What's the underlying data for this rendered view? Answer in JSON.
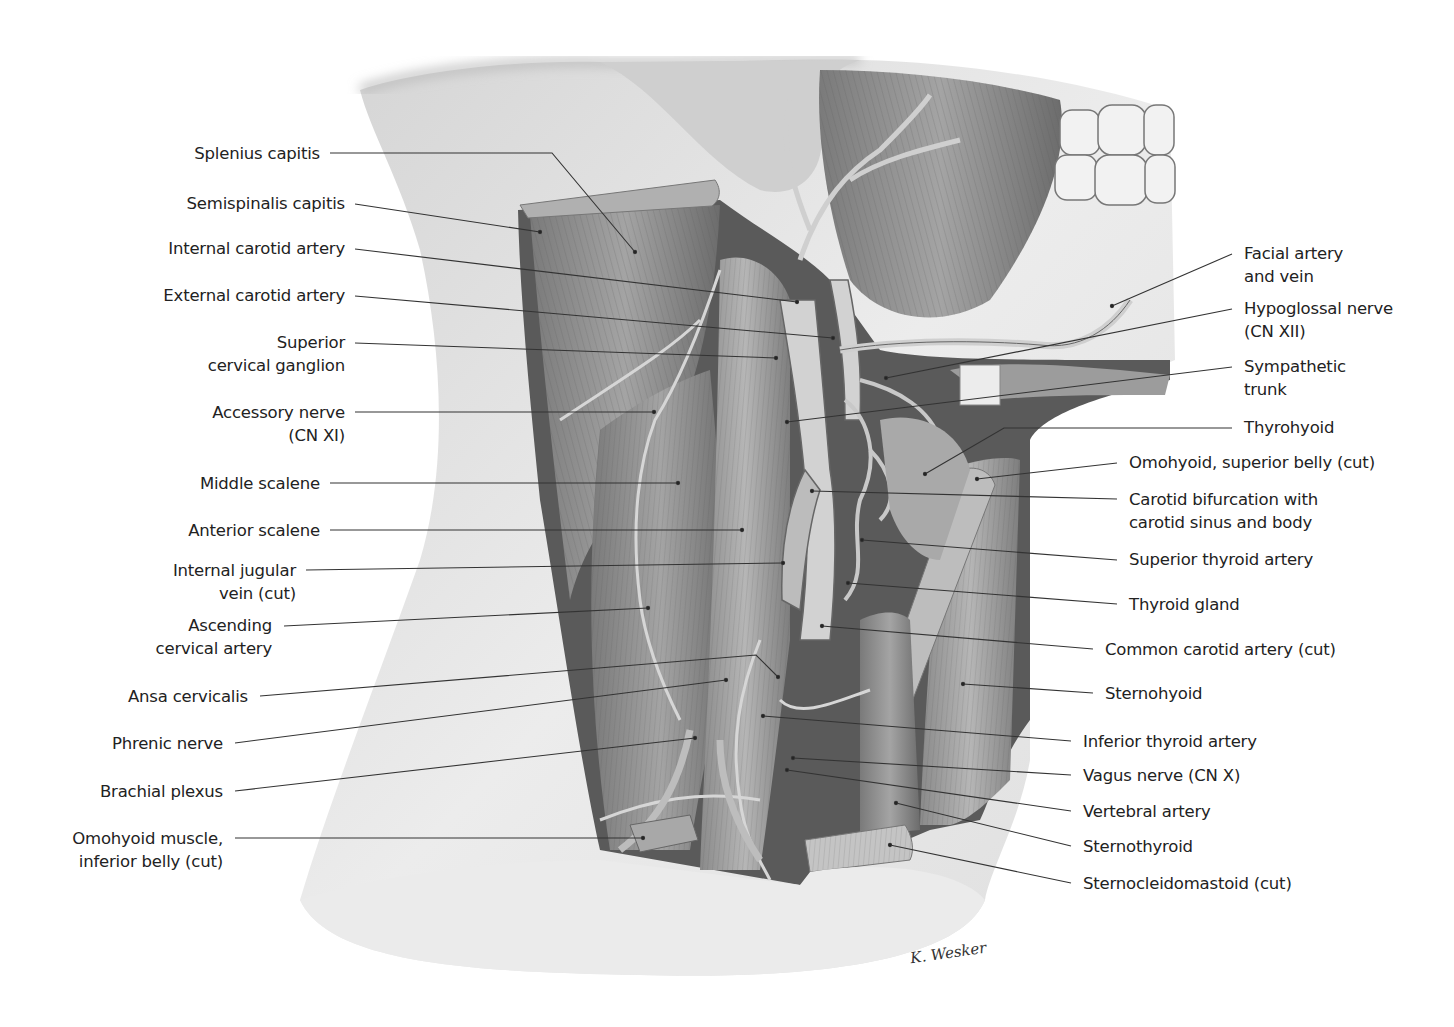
{
  "figure": {
    "style": "grayscale pencil anatomical illustration",
    "colors": {
      "background": "#ffffff",
      "text": "#222222",
      "leader": "#333333",
      "skin": "#e6e6e6",
      "muscle_dark": "#6e6e6e",
      "muscle_mid": "#9a9a9a",
      "vessel": "#c8c8c8"
    },
    "signature": "K. Wesker"
  },
  "labels_left": [
    {
      "id": "splenius-capitis",
      "lines": [
        "Splenius capitis"
      ],
      "x": 320,
      "y": 142,
      "lx": 330,
      "ly": 153,
      "tx": 635,
      "ty": 252,
      "bend": [
        552,
        153
      ]
    },
    {
      "id": "semispinalis-capitis",
      "lines": [
        "Semispinalis capitis"
      ],
      "x": 345,
      "y": 192,
      "lx": 355,
      "ly": 204,
      "tx": 540,
      "ty": 232
    },
    {
      "id": "internal-carotid-artery",
      "lines": [
        "Internal carotid artery"
      ],
      "x": 345,
      "y": 237,
      "lx": 355,
      "ly": 249,
      "tx": 797,
      "ty": 302
    },
    {
      "id": "external-carotid-artery",
      "lines": [
        "External carotid artery"
      ],
      "x": 345,
      "y": 284,
      "lx": 355,
      "ly": 296,
      "tx": 833,
      "ty": 338
    },
    {
      "id": "superior-cervical-ganglion",
      "lines": [
        "Superior",
        "cervical ganglion"
      ],
      "x": 345,
      "y": 331,
      "lx": 355,
      "ly": 343,
      "tx": 776,
      "ty": 358
    },
    {
      "id": "accessory-nerve",
      "lines": [
        "Accessory nerve",
        "(CN XI)"
      ],
      "x": 345,
      "y": 401,
      "lx": 355,
      "ly": 412,
      "tx": 654,
      "ty": 412
    },
    {
      "id": "middle-scalene",
      "lines": [
        "Middle scalene"
      ],
      "x": 320,
      "y": 472,
      "lx": 330,
      "ly": 483,
      "tx": 678,
      "ty": 483
    },
    {
      "id": "anterior-scalene",
      "lines": [
        "Anterior scalene"
      ],
      "x": 320,
      "y": 519,
      "lx": 330,
      "ly": 530,
      "tx": 742,
      "ty": 530
    },
    {
      "id": "internal-jugular-vein",
      "lines": [
        "Internal jugular",
        "vein (cut)"
      ],
      "x": 296,
      "y": 559,
      "lx": 306,
      "ly": 570,
      "tx": 783,
      "ty": 563
    },
    {
      "id": "ascending-cervical-artery",
      "lines": [
        "Ascending",
        "cervical artery"
      ],
      "x": 272,
      "y": 614,
      "lx": 284,
      "ly": 626,
      "tx": 648,
      "ty": 608
    },
    {
      "id": "ansa-cervicalis",
      "lines": [
        "Ansa cervicalis"
      ],
      "x": 248,
      "y": 685,
      "lx": 260,
      "ly": 696,
      "tx": 778,
      "ty": 677,
      "bend": [
        756,
        655
      ]
    },
    {
      "id": "phrenic-nerve",
      "lines": [
        "Phrenic nerve"
      ],
      "x": 223,
      "y": 732,
      "lx": 235,
      "ly": 743,
      "tx": 726,
      "ty": 680
    },
    {
      "id": "brachial-plexus",
      "lines": [
        "Brachial plexus"
      ],
      "x": 223,
      "y": 780,
      "lx": 235,
      "ly": 791,
      "tx": 695,
      "ty": 738
    },
    {
      "id": "omohyoid-inferior-belly",
      "lines": [
        "Omohyoid muscle,",
        "inferior belly (cut)"
      ],
      "x": 223,
      "y": 827,
      "lx": 235,
      "ly": 838,
      "tx": 643,
      "ty": 838
    }
  ],
  "labels_right": [
    {
      "id": "facial-artery-and-vein",
      "lines": [
        "Facial artery",
        "and vein"
      ],
      "x": 1244,
      "y": 242,
      "lx": 1232,
      "ly": 254,
      "tx": 1112,
      "ty": 306
    },
    {
      "id": "hypoglossal-nerve",
      "lines": [
        "Hypoglossal nerve",
        "(CN XII)"
      ],
      "x": 1244,
      "y": 297,
      "lx": 1232,
      "ly": 309,
      "tx": 886,
      "ty": 378
    },
    {
      "id": "sympathetic-trunk",
      "lines": [
        "Sympathetic",
        "trunk"
      ],
      "x": 1244,
      "y": 355,
      "lx": 1232,
      "ly": 367,
      "tx": 787,
      "ty": 422
    },
    {
      "id": "thyrohyoid",
      "lines": [
        "Thyrohyoid"
      ],
      "x": 1244,
      "y": 416,
      "lx": 1232,
      "ly": 428,
      "tx": 925,
      "ty": 474,
      "bend": [
        1004,
        428
      ]
    },
    {
      "id": "omohyoid-superior-belly",
      "lines": [
        "Omohyoid, superior belly (cut)"
      ],
      "x": 1129,
      "y": 451,
      "lx": 1117,
      "ly": 463,
      "tx": 977,
      "ty": 479
    },
    {
      "id": "carotid-bifurcation",
      "lines": [
        "Carotid bifurcation with",
        "carotid sinus and body"
      ],
      "x": 1129,
      "y": 488,
      "lx": 1117,
      "ly": 499,
      "tx": 812,
      "ty": 491
    },
    {
      "id": "superior-thyroid-artery",
      "lines": [
        "Superior thyroid artery"
      ],
      "x": 1129,
      "y": 548,
      "lx": 1117,
      "ly": 560,
      "tx": 862,
      "ty": 540
    },
    {
      "id": "thyroid-gland",
      "lines": [
        "Thyroid gland"
      ],
      "x": 1129,
      "y": 593,
      "lx": 1117,
      "ly": 604,
      "tx": 848,
      "ty": 583
    },
    {
      "id": "common-carotid-artery",
      "lines": [
        "Common carotid artery (cut)"
      ],
      "x": 1105,
      "y": 638,
      "lx": 1093,
      "ly": 649,
      "tx": 822,
      "ty": 626
    },
    {
      "id": "sternohyoid",
      "lines": [
        "Sternohyoid"
      ],
      "x": 1105,
      "y": 682,
      "lx": 1093,
      "ly": 693,
      "tx": 963,
      "ty": 684
    },
    {
      "id": "inferior-thyroid-artery",
      "lines": [
        "Inferior thyroid artery"
      ],
      "x": 1083,
      "y": 730,
      "lx": 1071,
      "ly": 741,
      "tx": 763,
      "ty": 716
    },
    {
      "id": "vagus-nerve",
      "lines": [
        "Vagus nerve (CN X)"
      ],
      "x": 1083,
      "y": 764,
      "lx": 1071,
      "ly": 775,
      "tx": 793,
      "ty": 758
    },
    {
      "id": "vertebral-artery",
      "lines": [
        "Vertebral artery"
      ],
      "x": 1083,
      "y": 800,
      "lx": 1071,
      "ly": 811,
      "tx": 787,
      "ty": 770
    },
    {
      "id": "sternothyroid",
      "lines": [
        "Sternothyroid"
      ],
      "x": 1083,
      "y": 835,
      "lx": 1071,
      "ly": 846,
      "tx": 896,
      "ty": 803
    },
    {
      "id": "sternocleidomastoid",
      "lines": [
        "Sternocleidomastoid (cut)"
      ],
      "x": 1083,
      "y": 872,
      "lx": 1071,
      "ly": 883,
      "tx": 890,
      "ty": 845
    }
  ]
}
